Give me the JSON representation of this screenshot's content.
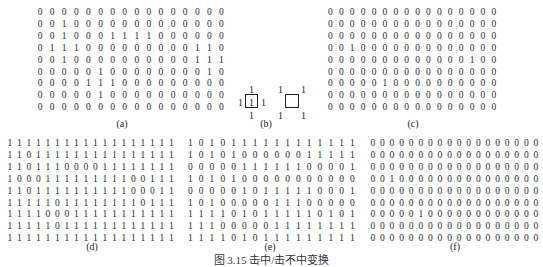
{
  "figure": {
    "caption": "图 3.15   击中/击不中变换",
    "panels": {
      "a": {
        "label": "(a)",
        "rows": [
          "0000000000000000",
          "0010000000000000",
          "0010001111000000",
          "0111000000000110",
          "0010000000000111",
          "0000010000000010",
          "0000111000000000",
          "0000010000000000",
          "0000000000000000"
        ]
      },
      "b": {
        "label": "(b)",
        "structuring_element_hit": {
          "top": "1",
          "left": "1",
          "center": "1",
          "right": "1",
          "bottom": "1"
        },
        "structuring_element_miss": {
          "top_left": "1",
          "top_right": "1",
          "bottom_left": "1",
          "bottom_right": "1"
        }
      },
      "c": {
        "label": "(c)",
        "rows": [
          "0000000000000000",
          "0000000000000000",
          "0000000000000000",
          "0010000000000000",
          "0000000000000100",
          "0000000000000000",
          "0000010000000000",
          "0000000000000000",
          "0000000000000000"
        ]
      },
      "d": {
        "label": "(d)",
        "rows": [
          "111111111111111111",
          "110111111111111111",
          "110111000011111111",
          "100011111111100111",
          "110111111111100011",
          "111110111111110111",
          "111100011111111111",
          "111110111111111111",
          "111111111111111111"
        ]
      },
      "e": {
        "label": "(e)",
        "rows": [
          "1010111111111111",
          "1010100000011111",
          "0000011111100001",
          "1010100000000000",
          "0000010111110001",
          "1010000011100000",
          "1111010111110101",
          "1110000011111111",
          "1111010111111111"
        ]
      },
      "f": {
        "label": "(f)",
        "rows": [
          "000000000000000000",
          "000000000000000000",
          "000000000000000000",
          "001000000000000000",
          "000000000000000000",
          "000000000000000000",
          "000001000000000000",
          "000000000000000000",
          "000000000000000000"
        ]
      }
    }
  }
}
